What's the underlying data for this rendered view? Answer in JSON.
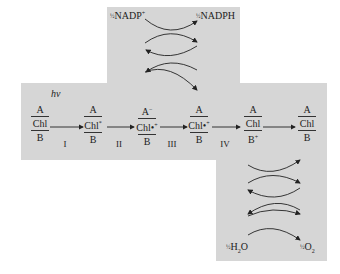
{
  "figure": {
    "light_label": "hν",
    "top_cycle": {
      "left": "NADP",
      "left_sup": "+",
      "right": "NADPH",
      "coefficient": "½"
    },
    "bottom_cycle": {
      "left": "H",
      "left_sub": "2",
      "left_tail": "O",
      "right": "O",
      "right_sub": "2",
      "coefficient": "½"
    },
    "states": [
      {
        "top": "A",
        "middle": "Chl",
        "middle_sup": "",
        "bottom": "B"
      },
      {
        "top": "A",
        "middle": "Chl",
        "middle_sup": "*",
        "bottom": "B"
      },
      {
        "top": "A",
        "top_sup": "−",
        "middle": "Chl•",
        "middle_sup": "+",
        "bottom": "B"
      },
      {
        "top": "A",
        "middle": "Chl•",
        "middle_sup": "+",
        "bottom": "B"
      },
      {
        "top": "A",
        "middle": "Chl",
        "middle_sup": "",
        "bottom": "B",
        "bottom_sup": "+"
      },
      {
        "top": "A",
        "middle": "Chl",
        "middle_sup": "",
        "bottom": "B"
      }
    ],
    "steps": [
      "I",
      "II",
      "III",
      "IV",
      ""
    ],
    "colors": {
      "background_panel": "#d6d6d6",
      "ink": "#222222"
    }
  }
}
